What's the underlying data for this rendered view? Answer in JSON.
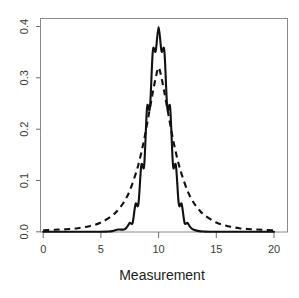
{
  "chart_data": {
    "type": "line",
    "title": "",
    "subtitle": "",
    "xlabel": "Measurement",
    "ylabel": "",
    "xlim": [
      0,
      20
    ],
    "ylim": [
      0.0,
      0.4
    ],
    "grid": false,
    "legend_position": "none",
    "x_ticks": [
      0,
      5,
      10,
      15,
      20
    ],
    "x_tick_labels": [
      "0",
      "5",
      "10",
      "15",
      "20"
    ],
    "y_ticks": [
      0.0,
      0.1,
      0.2,
      0.3,
      0.4
    ],
    "y_tick_labels": [
      "0.0",
      "0.1",
      "0.2",
      "0.3",
      "0.4"
    ],
    "annotations": [],
    "series": [
      {
        "name": "solid-density",
        "style": "solid",
        "color": "#111111",
        "peak_x": 10,
        "peak_y": 0.399,
        "x": [
          0,
          1,
          2,
          3,
          4,
          5,
          5.5,
          6,
          6.5,
          7,
          7.25,
          7.5,
          7.75,
          8,
          8.25,
          8.5,
          8.75,
          9,
          9.25,
          9.5,
          9.75,
          10,
          10.25,
          10.5,
          10.75,
          11,
          11.25,
          11.5,
          11.75,
          12,
          12.25,
          12.5,
          12.75,
          13,
          13.5,
          14,
          14.5,
          15,
          16,
          17,
          18,
          19,
          20
        ],
        "values": [
          0.0,
          0.0,
          0.0,
          0.0,
          0.0001,
          0.0001,
          0.0004,
          0.0013,
          0.0044,
          0.0044,
          0.0091,
          0.0175,
          0.0175,
          0.054,
          0.054,
          0.1295,
          0.1295,
          0.242,
          0.242,
          0.3521,
          0.3521,
          0.3989,
          0.3521,
          0.3521,
          0.242,
          0.242,
          0.1295,
          0.1295,
          0.054,
          0.054,
          0.0175,
          0.0175,
          0.0091,
          0.0044,
          0.0013,
          0.0004,
          0.0001,
          0.0001,
          0.0,
          0.0,
          0.0,
          0.0,
          0.0
        ]
      },
      {
        "name": "dashed-density",
        "style": "dashed",
        "color": "#111111",
        "peak_x": 10,
        "peak_y": 0.32,
        "x": [
          0,
          1,
          2,
          3,
          4,
          5,
          6,
          6.5,
          7,
          7.5,
          8,
          8.25,
          8.5,
          8.75,
          9,
          9.25,
          9.5,
          9.75,
          10,
          10.25,
          10.5,
          10.75,
          11,
          11.25,
          11.5,
          11.75,
          12,
          12.5,
          13,
          13.5,
          14,
          15,
          16,
          17,
          18,
          19,
          20
        ],
        "values": [
          0.003,
          0.004,
          0.005,
          0.007,
          0.011,
          0.018,
          0.032,
          0.043,
          0.058,
          0.08,
          0.112,
          0.131,
          0.154,
          0.18,
          0.21,
          0.241,
          0.272,
          0.3,
          0.32,
          0.3,
          0.272,
          0.241,
          0.21,
          0.18,
          0.154,
          0.131,
          0.112,
          0.08,
          0.058,
          0.043,
          0.032,
          0.018,
          0.011,
          0.007,
          0.005,
          0.004,
          0.003
        ]
      }
    ]
  },
  "axis": {
    "x_title": "Measurement"
  }
}
